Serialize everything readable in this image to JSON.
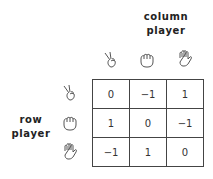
{
  "column_label": [
    "column",
    "player"
  ],
  "row_label": [
    "row",
    "player"
  ],
  "strategies": [
    {
      "name": "scissors",
      "icon": "scissors-hand-icon"
    },
    {
      "name": "rock",
      "icon": "fist-hand-icon"
    },
    {
      "name": "paper",
      "icon": "open-hand-icon"
    }
  ],
  "payoff_matrix": [
    [
      "0",
      "−1",
      "1"
    ],
    [
      "1",
      "0",
      "−1"
    ],
    [
      "−1",
      "1",
      "0"
    ]
  ]
}
